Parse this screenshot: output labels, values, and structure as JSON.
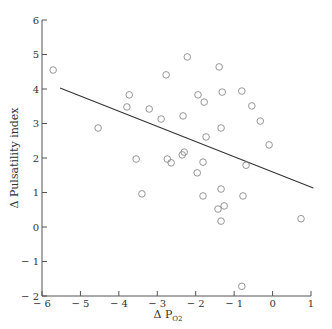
{
  "chart_data": {
    "type": "scatter",
    "title": "",
    "xlabel": "Δ P",
    "xlabel_subscript": "O2",
    "ylabel": "Δ Pulsatility index",
    "xlim": [
      -6,
      1
    ],
    "ylim": [
      -2,
      6
    ],
    "x_ticks": [
      -6,
      -5,
      -4,
      -3,
      -2,
      -1,
      0,
      1
    ],
    "x_tick_labels": [
      "− 6",
      "− 5",
      "− 4",
      "− 3",
      "− 2",
      "− 1",
      "0",
      "1"
    ],
    "y_ticks": [
      -2,
      -1,
      0,
      1,
      2,
      3,
      4,
      5,
      6
    ],
    "y_tick_labels": [
      "− 2",
      "− 1",
      "0",
      "1",
      "2",
      "3",
      "4",
      "5",
      "6"
    ],
    "grid": false,
    "legend": null,
    "marker": "open-circle",
    "colors": {
      "axis": "#555555",
      "marker": "#8a8a8a",
      "line": "#333333"
    },
    "series": [
      {
        "name": "observations",
        "points": [
          [
            -5.71,
            4.55
          ],
          [
            -3.73,
            3.83
          ],
          [
            -3.79,
            3.48
          ],
          [
            -4.54,
            2.87
          ],
          [
            -3.21,
            3.42
          ],
          [
            -2.9,
            3.13
          ],
          [
            -2.77,
            4.41
          ],
          [
            -2.22,
            4.93
          ],
          [
            -1.39,
            4.64
          ],
          [
            -1.31,
            3.91
          ],
          [
            -0.8,
            3.94
          ],
          [
            -1.94,
            3.83
          ],
          [
            -1.78,
            3.62
          ],
          [
            -2.33,
            3.22
          ],
          [
            -0.54,
            3.51
          ],
          [
            -0.32,
            3.07
          ],
          [
            -1.34,
            2.87
          ],
          [
            -1.73,
            2.61
          ],
          [
            -0.09,
            2.38
          ],
          [
            -1.81,
            1.88
          ],
          [
            -0.69,
            1.79
          ],
          [
            -3.55,
            1.97
          ],
          [
            -2.74,
            1.97
          ],
          [
            -2.64,
            1.86
          ],
          [
            -2.3,
            2.17
          ],
          [
            -2.35,
            2.09
          ],
          [
            -1.96,
            1.57
          ],
          [
            -3.4,
            0.96
          ],
          [
            -1.81,
            0.9
          ],
          [
            -1.34,
            1.1
          ],
          [
            -0.77,
            0.9
          ],
          [
            -1.26,
            0.61
          ],
          [
            -1.42,
            0.52
          ],
          [
            -1.34,
            0.17
          ],
          [
            0.74,
            0.24
          ],
          [
            -0.8,
            -1.72
          ]
        ]
      }
    ],
    "regression_line": {
      "x": [
        -5.53,
        1.06
      ],
      "y": [
        4.03,
        1.13
      ]
    }
  }
}
